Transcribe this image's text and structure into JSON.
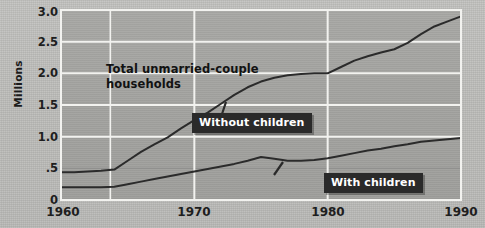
{
  "chart_data": {
    "type": "line",
    "title": "",
    "xlabel": "",
    "ylabel": "Millions",
    "xlim": [
      1960,
      1990
    ],
    "ylim": [
      0,
      3.0
    ],
    "grid": true,
    "legend_position": "inline-callouts",
    "y_ticks": [
      "0",
      ".5",
      "1.0",
      "1.5",
      "2.0",
      "2.5",
      "3.0"
    ],
    "y_tick_values": [
      0,
      0.5,
      1.0,
      1.5,
      2.0,
      2.5,
      3.0
    ],
    "x_ticks": [
      "1960",
      "1970",
      "1980",
      "1990"
    ],
    "x_tick_values": [
      1960,
      1970,
      1980,
      1990
    ],
    "x_gridlines": [
      1960,
      1963.7,
      1970,
      1980,
      1990
    ],
    "annotations": [
      {
        "name": "total-label",
        "text": "Total unmarried-couple\nhouseholds",
        "style": "plain"
      },
      {
        "name": "without-children-callout",
        "text": "Without children",
        "style": "dark-box"
      },
      {
        "name": "with-children-callout",
        "text": "With children",
        "style": "dark-box"
      }
    ],
    "series": [
      {
        "name": "Without children",
        "x": [
          1960,
          1961,
          1962,
          1963,
          1964,
          1965,
          1966,
          1967,
          1968,
          1969,
          1970,
          1971,
          1972,
          1973,
          1974,
          1975,
          1976,
          1977,
          1978,
          1979,
          1980,
          1981,
          1982,
          1983,
          1984,
          1985,
          1986,
          1987,
          1988,
          1989,
          1990
        ],
        "y": [
          0.44,
          0.44,
          0.45,
          0.46,
          0.48,
          0.62,
          0.76,
          0.88,
          0.99,
          1.13,
          1.26,
          1.38,
          1.52,
          1.66,
          1.78,
          1.87,
          1.93,
          1.97,
          1.99,
          2.0,
          2.0,
          2.1,
          2.2,
          2.27,
          2.33,
          2.38,
          2.48,
          2.62,
          2.74,
          2.82,
          2.9
        ]
      },
      {
        "name": "With children",
        "x": [
          1960,
          1961,
          1962,
          1963,
          1964,
          1965,
          1966,
          1967,
          1968,
          1969,
          1970,
          1971,
          1972,
          1973,
          1974,
          1975,
          1976,
          1977,
          1978,
          1979,
          1980,
          1981,
          1982,
          1983,
          1984,
          1985,
          1986,
          1987,
          1988,
          1989,
          1990
        ],
        "y": [
          0.2,
          0.2,
          0.2,
          0.2,
          0.21,
          0.25,
          0.29,
          0.33,
          0.37,
          0.41,
          0.45,
          0.49,
          0.53,
          0.57,
          0.62,
          0.68,
          0.65,
          0.62,
          0.62,
          0.63,
          0.66,
          0.7,
          0.74,
          0.78,
          0.81,
          0.85,
          0.88,
          0.92,
          0.94,
          0.96,
          0.98
        ]
      }
    ],
    "colors": {
      "plot_background": "#a4a4a1",
      "page_background": "#bdbdba",
      "gridline_major": "#f2f2ef",
      "gridline_minor": "#8f8f8c",
      "line": "#2b2b2b",
      "callout_background": "#2a2a2a",
      "callout_text": "#ffffff",
      "tick_text": "#1e1e1e"
    }
  }
}
